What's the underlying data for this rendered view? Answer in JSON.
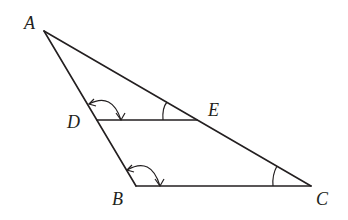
{
  "diagram": {
    "type": "geometry-triangle",
    "stroke_color": "#231f20",
    "background": "#ffffff",
    "points": {
      "A": {
        "label": "A",
        "x": 44,
        "y": 31
      },
      "B": {
        "label": "B",
        "x": 136,
        "y": 186
      },
      "C": {
        "label": "C",
        "x": 311,
        "y": 186
      },
      "D": {
        "label": "D",
        "x": 97,
        "y": 120
      },
      "E": {
        "label": "E",
        "x": 197,
        "y": 120
      }
    },
    "segments": [
      "AB",
      "AC",
      "BC",
      "DE"
    ],
    "angle_marks": [
      {
        "vertex": "D",
        "between": [
          "A",
          "E"
        ],
        "style": "double-arrow-arc"
      },
      {
        "vertex": "B",
        "between": [
          "D",
          "C"
        ],
        "style": "double-arrow-arc"
      },
      {
        "vertex": "E",
        "between": [
          "A",
          "D"
        ],
        "style": "single-arc"
      },
      {
        "vertex": "C",
        "between": [
          "A",
          "B"
        ],
        "style": "single-arc"
      }
    ]
  }
}
